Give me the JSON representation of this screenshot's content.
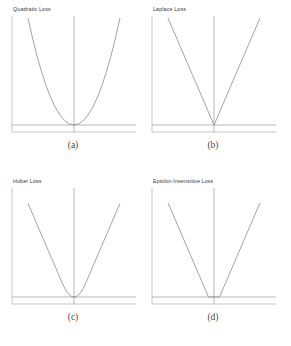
{
  "figure": {
    "background": "#ffffff",
    "line_color": "#8c8c8c",
    "frame_color": "#b0b0b0",
    "text_color": "#3b3b3b"
  },
  "panels": [
    {
      "id": "quadratic-loss",
      "title": "Quadratic Loss",
      "caption": "(a)"
    },
    {
      "id": "laplace-loss",
      "title": "Laplace Loss",
      "caption": "(b)"
    },
    {
      "id": "huber-loss",
      "title": "Huber Loss",
      "caption": "(c)"
    },
    {
      "id": "epsilon-insensitive-loss",
      "title": "Epsilon-Insensitive Loss",
      "caption": "(d)"
    }
  ],
  "chart_data": [
    {
      "type": "line",
      "title": "Quadratic Loss",
      "subfigure": "(a)",
      "xlabel": "",
      "ylabel": "",
      "xlim": [
        -1,
        1
      ],
      "ylim": [
        0,
        1
      ],
      "grid": false,
      "legend": null,
      "formula": "L(r) = r^2",
      "axes": {
        "vertical_zero_line_x": 0,
        "horizontal_zero_line_y": 0
      },
      "x": [
        -1.0,
        -0.9,
        -0.8,
        -0.7,
        -0.6,
        -0.5,
        -0.4,
        -0.3,
        -0.2,
        -0.1,
        0.0,
        0.1,
        0.2,
        0.3,
        0.4,
        0.5,
        0.6,
        0.7,
        0.8,
        0.9,
        1.0
      ],
      "values": [
        1.0,
        0.81,
        0.64,
        0.49,
        0.36,
        0.25,
        0.16,
        0.09,
        0.04,
        0.01,
        0.0,
        0.01,
        0.04,
        0.09,
        0.16,
        0.25,
        0.36,
        0.49,
        0.64,
        0.81,
        1.0
      ]
    },
    {
      "type": "line",
      "title": "Laplace Loss",
      "subfigure": "(b)",
      "xlabel": "",
      "ylabel": "",
      "xlim": [
        -1,
        1
      ],
      "ylim": [
        0,
        1
      ],
      "grid": false,
      "legend": null,
      "formula": "L(r) = |r|",
      "axes": {
        "vertical_zero_line_x": 0,
        "horizontal_zero_line_y": 0
      },
      "x": [
        -1.0,
        -0.75,
        -0.5,
        -0.25,
        0.0,
        0.25,
        0.5,
        0.75,
        1.0
      ],
      "values": [
        1.0,
        0.75,
        0.5,
        0.25,
        0.0,
        0.25,
        0.5,
        0.75,
        1.0
      ]
    },
    {
      "type": "line",
      "title": "Huber Loss",
      "subfigure": "(c)",
      "xlabel": "",
      "ylabel": "",
      "xlim": [
        -1,
        1
      ],
      "ylim": [
        0,
        1
      ],
      "grid": false,
      "legend": null,
      "formula": "L(r) = r^2/(2d) for |r|<=d ; |r| - d/2 for |r|>d , d = 0.25",
      "axes": {
        "vertical_zero_line_x": 0,
        "horizontal_zero_line_y": 0
      },
      "x": [
        -1.0,
        -0.8,
        -0.6,
        -0.4,
        -0.25,
        -0.2,
        -0.15,
        -0.1,
        -0.05,
        0.0,
        0.05,
        0.1,
        0.15,
        0.2,
        0.25,
        0.4,
        0.6,
        0.8,
        1.0
      ],
      "values": [
        0.875,
        0.675,
        0.475,
        0.275,
        0.125,
        0.08,
        0.045,
        0.02,
        0.005,
        0.0,
        0.005,
        0.02,
        0.045,
        0.08,
        0.125,
        0.275,
        0.475,
        0.675,
        0.875
      ]
    },
    {
      "type": "line",
      "title": "Epsilon-Insensitive Loss",
      "subfigure": "(d)",
      "xlabel": "",
      "ylabel": "",
      "xlim": [
        -1,
        1
      ],
      "ylim": [
        0,
        1
      ],
      "grid": false,
      "legend": null,
      "formula": "L(r) = max(0, |r| - e), e = 0.12",
      "axes": {
        "vertical_zero_line_x": 0,
        "horizontal_zero_line_y": 0
      },
      "x": [
        -1.0,
        -0.5,
        -0.12,
        0.0,
        0.12,
        0.5,
        1.0
      ],
      "values": [
        0.88,
        0.38,
        0.0,
        0.0,
        0.0,
        0.38,
        0.88
      ]
    }
  ]
}
